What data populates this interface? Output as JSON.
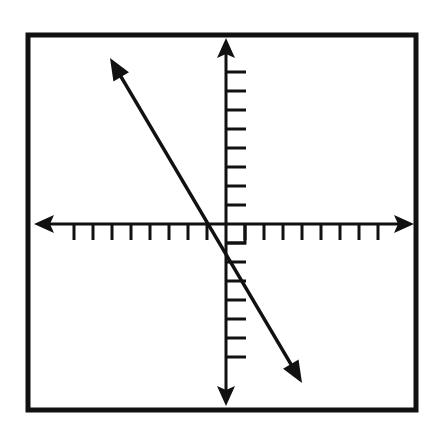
{
  "problem_label": ")",
  "graph": {
    "frame": {
      "x": 28,
      "y": 35,
      "width": 388,
      "height": 375,
      "stroke": "#111111",
      "stroke_width": 5
    },
    "origin_px": {
      "x": 226,
      "y": 224
    },
    "unit_px": 19,
    "x_axis": {
      "left_px": 34,
      "right_px": 414,
      "ticks_negative": 8,
      "ticks_positive": 8,
      "tick_length_px": 16,
      "tick_side": "below"
    },
    "y_axis": {
      "top_px": 38,
      "bottom_px": 406,
      "ticks_positive": 8,
      "ticks_negative": 7,
      "tick_length_px": 20,
      "tick_side": "right"
    },
    "right_angle_marker": {
      "size_px": 19
    },
    "line": {
      "equation": "y = -2x - 2",
      "slope": -2,
      "y_intercept": -2,
      "x_intercept": -1,
      "start_px": {
        "x": 110,
        "y": 58
      },
      "end_px": {
        "x": 302,
        "y": 383
      },
      "arrows": "both",
      "color": "#111111"
    }
  }
}
